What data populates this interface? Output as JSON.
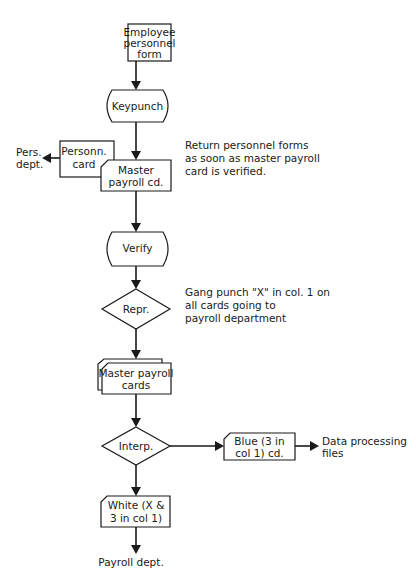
{
  "diagram": {
    "type": "flowchart",
    "colors": {
      "stroke": "#1a1a1a",
      "background": "#ffffff"
    },
    "nodes": {
      "employee_form": {
        "shape": "process",
        "lines": [
          "Employee",
          "personnel",
          "form"
        ]
      },
      "keypunch": {
        "shape": "manual-operation",
        "lines": [
          "Keypunch"
        ]
      },
      "personnel_card": {
        "shape": "card",
        "lines": [
          "Personn.",
          "card"
        ]
      },
      "master_payroll_cd": {
        "shape": "punched-card",
        "lines": [
          "Master",
          "payroll cd."
        ]
      },
      "verify": {
        "shape": "manual-operation",
        "lines": [
          "Verify"
        ]
      },
      "repr": {
        "shape": "decision",
        "lines": [
          "Repr."
        ]
      },
      "master_payroll_cards": {
        "shape": "card-deck",
        "lines": [
          "Master payroll",
          "cards"
        ]
      },
      "interp": {
        "shape": "decision",
        "lines": [
          "Interp."
        ]
      },
      "blue_card": {
        "shape": "punched-card",
        "lines": [
          "Blue (3 in",
          "col 1) cd."
        ]
      },
      "white_card": {
        "shape": "punched-card",
        "lines": [
          "White (X &",
          "3 in col 1)"
        ]
      }
    },
    "terminals": {
      "pers_dept": {
        "lines": [
          "Pers.",
          "dept."
        ]
      },
      "data_processing": {
        "lines": [
          "Data processing",
          "files"
        ]
      },
      "payroll_dept": {
        "lines": [
          "Payroll dept."
        ]
      }
    },
    "notes": {
      "return_forms": {
        "lines": [
          "Return personnel forms",
          "as soon as master payroll",
          "card is verified."
        ]
      },
      "gang_punch": {
        "lines": [
          "Gang punch \"X\" in col. 1 on",
          "all cards going to",
          "payroll department"
        ]
      }
    },
    "edges": [
      {
        "from": "employee_form",
        "to": "keypunch"
      },
      {
        "from": "keypunch",
        "to": "master_payroll_cd"
      },
      {
        "from": "personnel_card",
        "to": "pers_dept"
      },
      {
        "from": "master_payroll_cd",
        "to": "verify"
      },
      {
        "from": "verify",
        "to": "repr"
      },
      {
        "from": "repr",
        "to": "master_payroll_cards"
      },
      {
        "from": "master_payroll_cards",
        "to": "interp"
      },
      {
        "from": "interp",
        "to": "blue_card"
      },
      {
        "from": "blue_card",
        "to": "data_processing"
      },
      {
        "from": "interp",
        "to": "white_card"
      },
      {
        "from": "white_card",
        "to": "payroll_dept"
      }
    ]
  }
}
